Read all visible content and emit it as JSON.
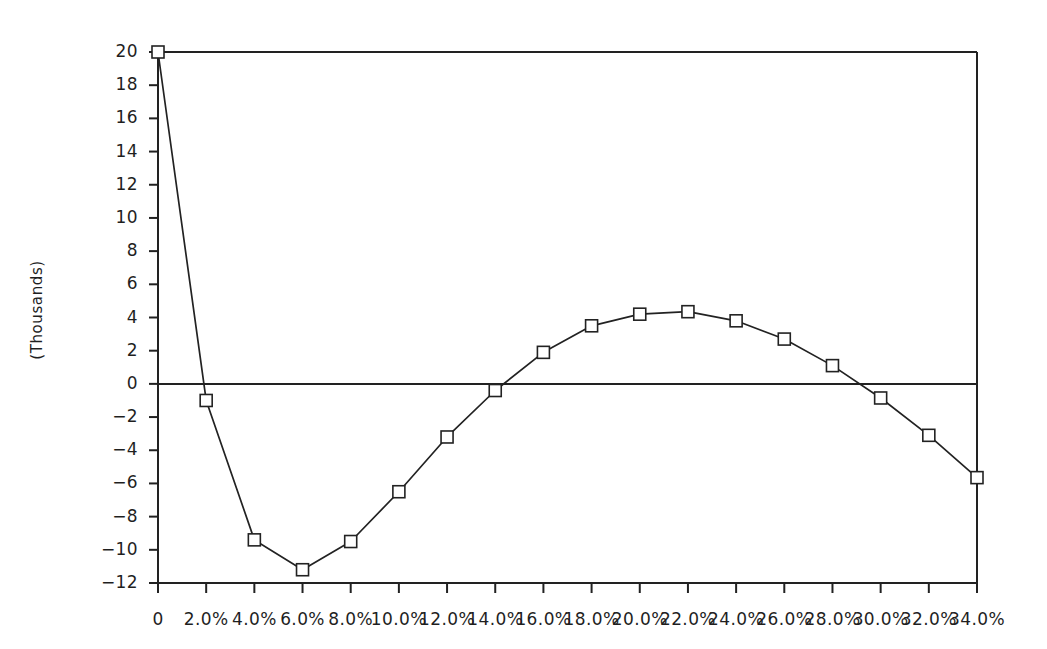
{
  "chart_data": {
    "type": "line",
    "title": "",
    "subtitle": "",
    "xlabel": "",
    "ylabel": "(Thousands)",
    "grid": false,
    "legend": null,
    "zero_line": true,
    "marker": "open-square",
    "xlim": [
      0,
      34
    ],
    "ylim": [
      -12,
      20
    ],
    "x_tick_step": 2,
    "y_tick_step": 2,
    "x": [
      0,
      2,
      4,
      6,
      8,
      10,
      12,
      14,
      16,
      18,
      20,
      22,
      24,
      26,
      28,
      30,
      32,
      34
    ],
    "categories": [
      "0",
      "2.0%",
      "4.0%",
      "6.0%",
      "8.0%",
      "10.0%",
      "12.0%",
      "14.0%",
      "16.0%",
      "18.0%",
      "20.0%",
      "22.0%",
      "24.0%",
      "26.0%",
      "28.0%",
      "30.0%",
      "32.0%",
      "34.0%"
    ],
    "values": [
      20.0,
      -1.0,
      -9.4,
      -11.2,
      -9.5,
      -6.5,
      -3.2,
      -0.4,
      1.9,
      3.5,
      4.2,
      4.35,
      3.8,
      2.7,
      1.1,
      -0.85,
      -3.1,
      -5.65
    ],
    "y_tick_labels": [
      "20",
      "18",
      "16",
      "14",
      "12",
      "10",
      "8",
      "6",
      "4",
      "2",
      "0",
      "-2",
      "-4",
      "-6",
      "-8",
      "-10",
      "-12"
    ],
    "y_tick_values": [
      20,
      18,
      16,
      14,
      12,
      10,
      8,
      6,
      4,
      2,
      0,
      -2,
      -4,
      -6,
      -8,
      -10,
      -12
    ],
    "colors": {
      "line": "#222222",
      "marker_fill": "#ffffff",
      "marker_stroke": "#222222",
      "axis": "#222222",
      "text": "#1f1f1f",
      "background": "#ffffff"
    }
  }
}
